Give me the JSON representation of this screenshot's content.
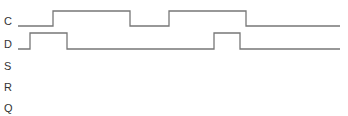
{
  "diagram": {
    "type": "timing-diagram",
    "signals": [
      {
        "name": "C",
        "label_y": 15,
        "waveform": "low-high-low-high-low",
        "points": "18,26 53,26 53,11 130,11 130,26 169,26 169,11 246,11 246,26 340,26"
      },
      {
        "name": "D",
        "label_y": 38,
        "waveform": "low-high-low-high-low",
        "points": "18,49 30,49 30,33 67,33 67,49 214,49 214,33 240,33 240,49 340,49"
      },
      {
        "name": "S",
        "label_y": 60
      },
      {
        "name": "R",
        "label_y": 81
      },
      {
        "name": "Q",
        "label_y": 102
      }
    ],
    "line_color": "#777777"
  }
}
